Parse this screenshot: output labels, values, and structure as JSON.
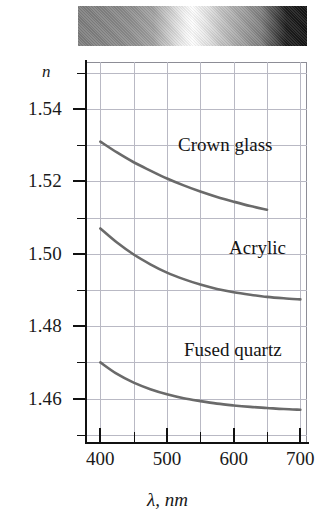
{
  "figure": {
    "spectrum_bar": {
      "name": "visible-spectrum-strip",
      "description": "grayscale spectrum band"
    }
  },
  "chart_data": {
    "type": "line",
    "title": "",
    "xlabel": "λ, nm",
    "ylabel": "n",
    "xlim": [
      380,
      710
    ],
    "ylim": [
      1.448,
      1.553
    ],
    "grid": true,
    "legend": "inline-labels",
    "x_ticks": [
      400,
      500,
      600,
      700
    ],
    "x_tick_labels": [
      "400",
      "500",
      "600",
      "700"
    ],
    "x_minor_ticks": [
      450,
      550,
      650
    ],
    "y_ticks": [
      1.54,
      1.52,
      1.5,
      1.48,
      1.46
    ],
    "y_tick_labels": [
      "1.54",
      "1.52",
      "1.50",
      "1.48",
      "1.46"
    ],
    "y_minor_ticks": [
      1.55,
      1.53,
      1.51,
      1.49,
      1.47,
      1.45
    ],
    "series": [
      {
        "name": "Crown glass",
        "color": "#6a6a6a",
        "x": [
          400,
          425,
          450,
          475,
          500,
          525,
          550,
          575,
          600,
          625,
          650
        ],
        "y": [
          1.531,
          1.528,
          1.5253,
          1.523,
          1.5208,
          1.5189,
          1.5172,
          1.5157,
          1.5144,
          1.5132,
          1.5122
        ]
      },
      {
        "name": "Acrylic",
        "color": "#6a6a6a",
        "x": [
          400,
          425,
          450,
          475,
          500,
          525,
          550,
          575,
          600,
          625,
          650,
          675,
          700
        ],
        "y": [
          1.507,
          1.5031,
          1.4998,
          1.4971,
          1.4948,
          1.493,
          1.4915,
          1.4903,
          1.4894,
          1.4887,
          1.4881,
          1.4877,
          1.4874
        ]
      },
      {
        "name": "Fused quartz",
        "color": "#6a6a6a",
        "x": [
          400,
          425,
          450,
          475,
          500,
          525,
          550,
          575,
          600,
          625,
          650,
          675,
          700
        ],
        "y": [
          1.47,
          1.4668,
          1.4644,
          1.4626,
          1.4612,
          1.4601,
          1.4593,
          1.4586,
          1.4581,
          1.4577,
          1.4574,
          1.4571,
          1.4569
        ]
      }
    ],
    "annotations": [
      {
        "text": "Crown glass",
        "x": 545,
        "y": 1.527
      },
      {
        "text": "Acrylic",
        "x": 630,
        "y": 1.501
      },
      {
        "text": "Fused quartz",
        "x": 565,
        "y": 1.482
      }
    ]
  },
  "colors": {
    "curve": "#6a6a6a",
    "axis": "#111111",
    "grid": "#b9b9c4",
    "text": "#1a1a1a"
  }
}
